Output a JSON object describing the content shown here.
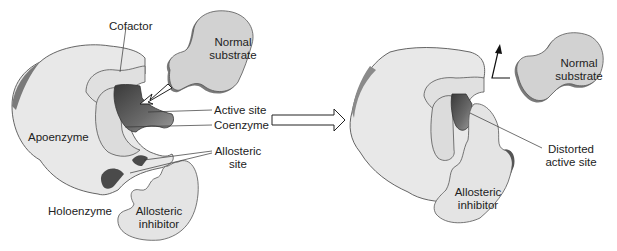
{
  "diagram": {
    "colors": {
      "body_fill": "#e6e6e6",
      "body_stroke": "#555555",
      "inner_fill": "#dcdcdc",
      "site_dark": "#4a4a4a",
      "substrate_fill": "#d0d0d0",
      "substrate_edge": "#7a7a7a",
      "text": "#222222"
    },
    "left_panel": {
      "labels": {
        "cofactor": "Cofactor",
        "normal_substrate_line1": "Normal",
        "normal_substrate_line2": "substrate",
        "active_site": "Active site",
        "coenzyme": "Coenzyme",
        "apoenzyme": "Apoenzyme",
        "allosteric_site_line1": "Allosteric",
        "allosteric_site_line2": "site",
        "holoenzyme": "Holoenzyme",
        "allosteric_inhibitor_line1": "Allosteric",
        "allosteric_inhibitor_line2": "inhibitor"
      }
    },
    "transition_arrow": "hollow-right-arrow",
    "right_panel": {
      "labels": {
        "normal_substrate_line1": "Normal",
        "normal_substrate_line2": "substrate",
        "distorted_active_site_line1": "Distorted",
        "distorted_active_site_line2": "active site",
        "allosteric_inhibitor_line1": "Allosteric",
        "allosteric_inhibitor_line2": "inhibitor"
      },
      "repelled_arrow": "bent-up-arrow"
    }
  }
}
